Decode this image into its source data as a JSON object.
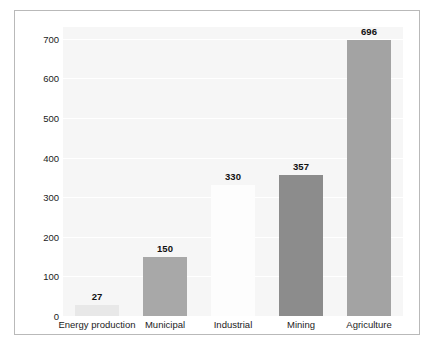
{
  "chart_data": {
    "type": "bar",
    "title": "",
    "xlabel": "",
    "ylabel": "Waste (million tonnes/year)",
    "categories": [
      "Energy production",
      "Municipal",
      "Industrial",
      "Mining",
      "Agriculture"
    ],
    "values": [
      27,
      150,
      330,
      357,
      696
    ],
    "value_labels": [
      "27",
      "150",
      "330",
      "357",
      "696"
    ],
    "bar_colors": [
      "#e8e8e8",
      "#a8a8a8",
      "#fdfdfd",
      "#8c8c8c",
      "#a3a3a3"
    ],
    "ylim": [
      0,
      730
    ],
    "yticks": [
      0,
      100,
      200,
      300,
      400,
      500,
      600,
      700
    ],
    "ytick_labels": [
      "0",
      "100",
      "200",
      "300",
      "400",
      "500",
      "600",
      "700"
    ],
    "grid": true,
    "grid_color": "#ffffff",
    "plot_background": "#f6f6f6",
    "frame_color": "#b9b9b9",
    "legend": "none"
  }
}
